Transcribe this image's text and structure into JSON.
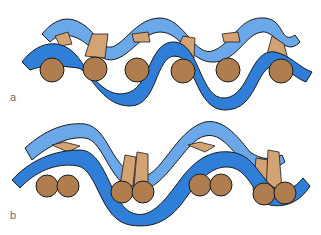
{
  "panels": [
    {
      "id": "a",
      "label": "a",
      "description": "Single alternating rod arrangement between two wavy bands"
    },
    {
      "id": "b",
      "label": "b",
      "description": "Paired rod arrangement between two wavy bands"
    }
  ],
  "colors": {
    "dark_band": "#2f7fd9",
    "light_band": "#6aa8ea",
    "rod_face": "#b07d4f",
    "rod_side": "#d4a373",
    "outline": "#1b1b1b",
    "label": "#6a6a6a"
  }
}
